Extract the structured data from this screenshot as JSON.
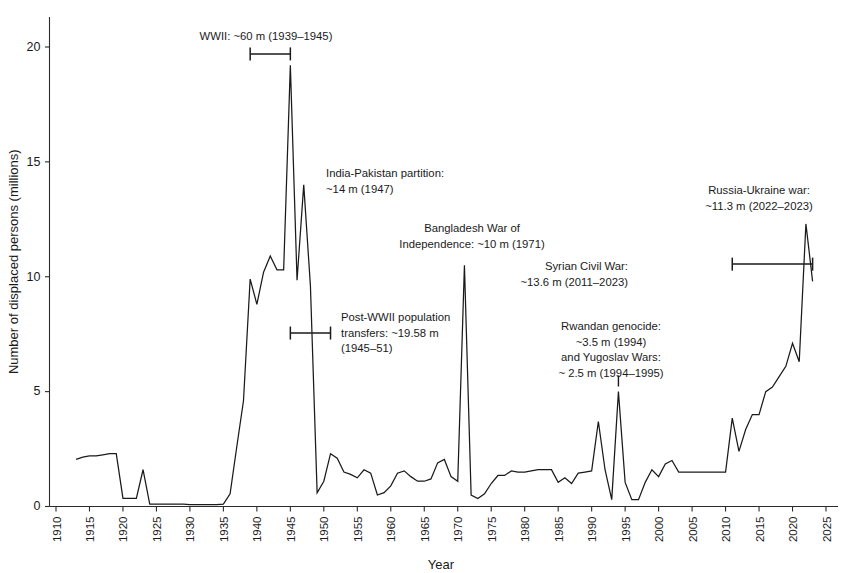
{
  "chart_data": {
    "type": "line",
    "title": "",
    "subtitle": "",
    "xlabel": "Year",
    "ylabel": "Number of displaced persons (millions)",
    "xlim": [
      1910,
      2027
    ],
    "ylim": [
      -0.6,
      21.8
    ],
    "grid": false,
    "legend": null,
    "xticks": [
      1910,
      1915,
      1920,
      1925,
      1930,
      1935,
      1940,
      1945,
      1950,
      1955,
      1960,
      1965,
      1970,
      1975,
      1980,
      1985,
      1990,
      1995,
      2000,
      2005,
      2010,
      2015,
      2020,
      2025
    ],
    "yticks": [
      0,
      5,
      10,
      15,
      20
    ],
    "series": [
      {
        "name": "Displaced persons",
        "x": [
          1913,
          1914,
          1915,
          1916,
          1917,
          1918,
          1919,
          1920,
          1921,
          1922,
          1923,
          1924,
          1925,
          1926,
          1927,
          1928,
          1929,
          1930,
          1931,
          1932,
          1933,
          1934,
          1935,
          1936,
          1937,
          1938,
          1939,
          1940,
          1941,
          1942,
          1943,
          1944,
          1945,
          1946,
          1947,
          1948,
          1949,
          1950,
          1951,
          1952,
          1953,
          1954,
          1955,
          1956,
          1957,
          1958,
          1959,
          1960,
          1961,
          1962,
          1963,
          1964,
          1965,
          1966,
          1967,
          1968,
          1969,
          1970,
          1971,
          1972,
          1973,
          1974,
          1975,
          1976,
          1977,
          1978,
          1979,
          1980,
          1981,
          1982,
          1983,
          1984,
          1985,
          1986,
          1987,
          1988,
          1989,
          1990,
          1991,
          1992,
          1993,
          1994,
          1995,
          1996,
          1997,
          1998,
          1999,
          2000,
          2001,
          2002,
          2003,
          2004,
          2005,
          2006,
          2007,
          2008,
          2009,
          2010,
          2011,
          2012,
          2013,
          2014,
          2015,
          2016,
          2017,
          2018,
          2019,
          2020,
          2021,
          2022,
          2023
        ],
        "values": [
          2.05,
          2.15,
          2.2,
          2.2,
          2.25,
          2.3,
          2.3,
          0.35,
          0.35,
          0.35,
          1.6,
          0.1,
          0.1,
          0.1,
          0.1,
          0.1,
          0.1,
          0.08,
          0.08,
          0.08,
          0.08,
          0.08,
          0.1,
          0.55,
          2.6,
          4.6,
          9.9,
          8.8,
          10.2,
          10.9,
          10.3,
          10.3,
          19.2,
          9.85,
          14.0,
          9.6,
          0.6,
          1.1,
          2.3,
          2.1,
          1.5,
          1.4,
          1.25,
          1.6,
          1.45,
          0.5,
          0.6,
          0.9,
          1.45,
          1.55,
          1.3,
          1.1,
          1.1,
          1.2,
          1.9,
          2.05,
          1.3,
          1.1,
          10.5,
          0.5,
          0.35,
          0.55,
          1.0,
          1.35,
          1.35,
          1.55,
          1.5,
          1.5,
          1.55,
          1.6,
          1.6,
          1.6,
          1.05,
          1.25,
          1.0,
          1.45,
          1.5,
          1.55,
          3.7,
          1.6,
          0.3,
          5.0,
          1.05,
          0.3,
          0.3,
          1.05,
          1.6,
          1.3,
          1.85,
          2.0,
          1.5,
          1.5,
          1.5,
          1.5,
          1.5,
          1.5,
          1.5,
          1.5,
          3.85,
          2.4,
          3.35,
          4.0,
          4.0,
          5.0,
          5.2,
          5.65,
          6.1,
          7.1,
          6.3,
          12.3,
          9.8
        ]
      }
    ],
    "annotations": [
      {
        "id": "wwii",
        "lines": [
          "WWII: ~60 m (1939–1945)"
        ],
        "text_x": 266,
        "text_y": 40,
        "align": "middle",
        "span": {
          "x_start": 1939,
          "x_end": 1945,
          "y": 19.7,
          "caps": "both"
        }
      },
      {
        "id": "india-pakistan-partition",
        "lines": [
          "India-Pakistan partition:",
          "~14 m (1947)"
        ],
        "text_x": 326,
        "text_y": 177,
        "align": "start",
        "span": null
      },
      {
        "id": "bangladesh-war",
        "lines": [
          "Bangladesh War of",
          "Independence: ~10 m (1971)"
        ],
        "text_x": 472,
        "text_y": 232,
        "align": "middle",
        "span": null
      },
      {
        "id": "post-wwii-transfers",
        "lines": [
          "Post-WWII population",
          "transfers: ~19.58 m",
          "(1945–51)"
        ],
        "text_x": 341,
        "text_y": 321,
        "align": "start",
        "span": {
          "x_start": 1945,
          "x_end": 1951,
          "y": 7.55,
          "caps": "both"
        }
      },
      {
        "id": "rwandan-genocide-yugoslav-wars",
        "lines": [
          "Rwandan genocide:",
          "~3.5 m (1994)",
          "and Yugoslav Wars:",
          "~ 2.5 m (1994–1995)"
        ],
        "text_x": 611,
        "text_y": 330,
        "align": "middle",
        "span": {
          "x_start": 1994,
          "x_end": 1994,
          "y": 5.7,
          "caps": "none"
        }
      },
      {
        "id": "syrian-civil-war",
        "lines": [
          "Syrian Civil War:",
          "~13.6 m (2011–2023)"
        ],
        "text_x": 628,
        "text_y": 270,
        "align": "end",
        "span": {
          "x_start": 2011,
          "x_end": 2023,
          "y": 10.55,
          "caps": "both"
        }
      },
      {
        "id": "russia-ukraine-war",
        "lines": [
          "Russia-Ukraine war:",
          "~11.3 m (2022–2023)"
        ],
        "text_x": 759,
        "text_y": 194,
        "align": "middle",
        "span": null
      }
    ]
  },
  "axes": {
    "y_title": "Number of displaced persons (millions)",
    "x_title": "Year",
    "y_tick_labels": [
      "0",
      "5",
      "10",
      "15",
      "20"
    ],
    "x_tick_labels": [
      "1910",
      "1915",
      "1920",
      "1925",
      "1930",
      "1935",
      "1940",
      "1945",
      "1950",
      "1955",
      "1960",
      "1965",
      "1970",
      "1975",
      "1980",
      "1985",
      "1990",
      "1995",
      "2000",
      "2005",
      "2010",
      "2015",
      "2020",
      "2025"
    ]
  },
  "style": {
    "line_color": "#1a1a1a",
    "axis_color": "#2b2b2b",
    "background": "#ffffff",
    "text_color": "#1a1a1a"
  }
}
